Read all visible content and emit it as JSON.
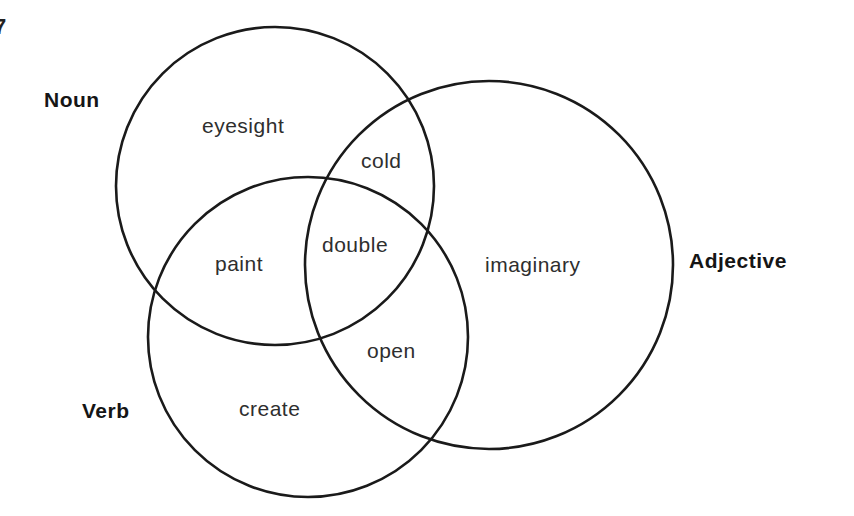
{
  "diagram": {
    "type": "venn",
    "sets": [
      {
        "name": "Noun",
        "cx": 275,
        "cy": 186,
        "r": 159
      },
      {
        "name": "Adjective",
        "cx": 489,
        "cy": 265,
        "r": 184
      },
      {
        "name": "Verb",
        "cx": 308,
        "cy": 337,
        "r": 160
      }
    ],
    "labels": {
      "noun": "Noun",
      "adjective": "Adjective",
      "verb": "Verb"
    },
    "regions": [
      {
        "sets": [
          "Noun"
        ],
        "word": "eyesight"
      },
      {
        "sets": [
          "Noun",
          "Adjective"
        ],
        "word": "cold"
      },
      {
        "sets": [
          "Noun",
          "Verb"
        ],
        "word": "paint"
      },
      {
        "sets": [
          "Noun",
          "Adjective",
          "Verb"
        ],
        "word": "double"
      },
      {
        "sets": [
          "Adjective"
        ],
        "word": "imaginary"
      },
      {
        "sets": [
          "Adjective",
          "Verb"
        ],
        "word": "open"
      },
      {
        "sets": [
          "Verb"
        ],
        "word": "create"
      }
    ],
    "edge_fragment": "7"
  }
}
